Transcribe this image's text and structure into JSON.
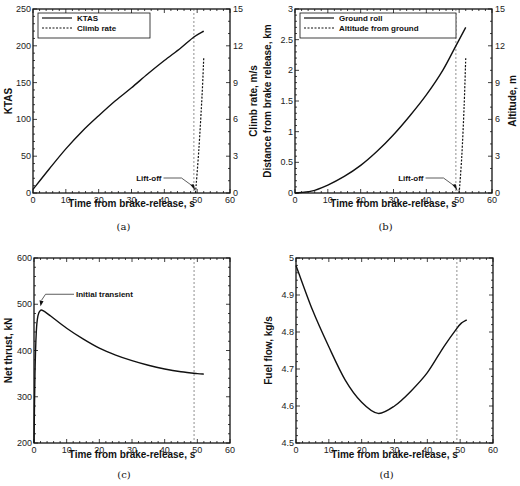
{
  "chart_data": [
    {
      "id": "a",
      "type": "line",
      "caption": "(a)",
      "title": "",
      "xlabel": "Time from brake-release, s",
      "ylabel": "KTAS",
      "y2label": "Climb rate, m/s",
      "xlim": [
        0,
        60
      ],
      "ylim": [
        0,
        250
      ],
      "y2lim": [
        0,
        15
      ],
      "xticks": [
        0,
        10,
        20,
        30,
        40,
        50,
        60
      ],
      "yticks": [
        0,
        50,
        100,
        150,
        200,
        250
      ],
      "y2ticks": [
        0,
        3,
        6,
        9,
        12,
        15
      ],
      "grid": false,
      "legend_position": "upper left",
      "liftoff_time": 49,
      "annotations": [
        {
          "text": "Lift-off",
          "x": 49.5,
          "y": 0
        }
      ],
      "series": [
        {
          "name": "KTAS",
          "style": "solid",
          "axis": "left",
          "x": [
            0,
            5,
            10,
            15,
            20,
            25,
            30,
            35,
            40,
            45,
            49,
            52
          ],
          "values": [
            5,
            33,
            60,
            84,
            105,
            125,
            143,
            162,
            180,
            197,
            212,
            220
          ]
        },
        {
          "name": "Climb rate",
          "style": "dashed",
          "axis": "right",
          "x": [
            49.5,
            50.5,
            51.5,
            52
          ],
          "values": [
            0,
            3.5,
            8,
            11
          ]
        }
      ]
    },
    {
      "id": "b",
      "type": "line",
      "caption": "(b)",
      "title": "",
      "xlabel": "Time from brake-release, s",
      "ylabel": "Distance from brake release, km",
      "y2label": "Altitude, m",
      "xlim": [
        0,
        60
      ],
      "ylim": [
        0,
        3
      ],
      "y2lim": [
        0,
        15
      ],
      "xticks": [
        0,
        10,
        20,
        30,
        40,
        50,
        60
      ],
      "yticks": [
        0,
        0.5,
        1,
        1.5,
        2,
        2.5,
        3
      ],
      "y2ticks": [
        0,
        3,
        6,
        9,
        12,
        15
      ],
      "grid": false,
      "legend_position": "upper left",
      "liftoff_time": 49,
      "annotations": [
        {
          "text": "Lift-off",
          "x": 49.5,
          "y": 0
        }
      ],
      "series": [
        {
          "name": "Ground roll",
          "style": "solid",
          "axis": "left",
          "x": [
            0,
            5,
            10,
            15,
            20,
            25,
            30,
            35,
            40,
            45,
            49,
            52
          ],
          "values": [
            0,
            0.03,
            0.13,
            0.27,
            0.45,
            0.68,
            0.95,
            1.26,
            1.6,
            2.0,
            2.4,
            2.7
          ]
        },
        {
          "name": "Altitude from ground",
          "style": "dashed",
          "axis": "right",
          "x": [
            50,
            50.8,
            51.5,
            52
          ],
          "values": [
            0,
            3,
            7,
            11
          ]
        }
      ]
    },
    {
      "id": "c",
      "type": "line",
      "caption": "(c)",
      "title": "",
      "xlabel": "Time from brake-release, s",
      "ylabel": "Net thrust, kN",
      "xlim": [
        0,
        60
      ],
      "ylim": [
        200,
        600
      ],
      "xticks": [
        0,
        10,
        20,
        30,
        40,
        50,
        60
      ],
      "yticks": [
        200,
        300,
        400,
        500,
        600
      ],
      "grid": false,
      "liftoff_time": 49,
      "annotations": [
        {
          "text": "Initial transient",
          "x": 2,
          "y": 487
        }
      ],
      "series": [
        {
          "name": "Net thrust",
          "style": "solid",
          "x": [
            0,
            0.3,
            0.7,
            1.2,
            2,
            3,
            5,
            10,
            15,
            20,
            25,
            30,
            35,
            40,
            45,
            50,
            52
          ],
          "values": [
            200,
            350,
            440,
            475,
            487,
            485,
            475,
            448,
            425,
            405,
            390,
            378,
            368,
            360,
            354,
            350,
            349
          ]
        }
      ]
    },
    {
      "id": "d",
      "type": "line",
      "caption": "(d)",
      "title": "",
      "xlabel": "Time from brake-release, s",
      "ylabel": "Fuel flow, kg/s",
      "xlim": [
        0,
        60
      ],
      "ylim": [
        4.5,
        5
      ],
      "xticks": [
        0,
        10,
        20,
        30,
        40,
        50,
        60
      ],
      "yticks": [
        4.5,
        4.6,
        4.7,
        4.8,
        4.9,
        5
      ],
      "grid": false,
      "liftoff_time": 49,
      "series": [
        {
          "name": "Fuel flow",
          "style": "solid",
          "x": [
            0,
            5,
            10,
            15,
            20,
            25,
            30,
            35,
            40,
            45,
            49,
            50.5,
            52
          ],
          "values": [
            4.98,
            4.86,
            4.76,
            4.67,
            4.61,
            4.58,
            4.6,
            4.64,
            4.69,
            4.76,
            4.81,
            4.825,
            4.833
          ]
        }
      ]
    }
  ]
}
